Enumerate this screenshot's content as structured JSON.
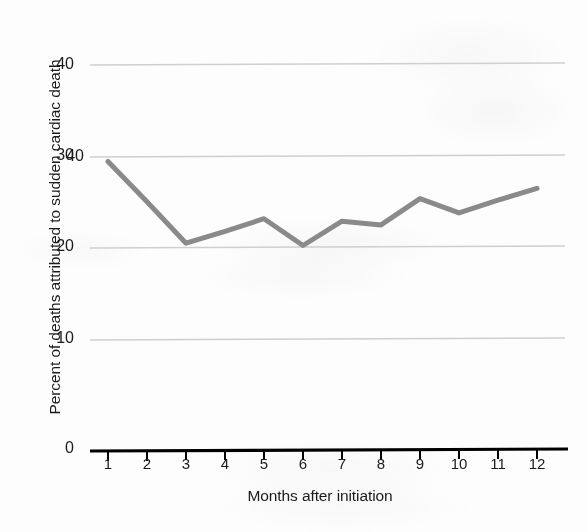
{
  "chart_data": {
    "type": "line",
    "title": "",
    "xlabel": "Months after initiation",
    "ylabel": "Percent of deaths attributed to sudden cardiac death",
    "x": [
      1,
      2,
      3,
      4,
      5,
      6,
      7,
      8,
      9,
      10,
      11,
      12
    ],
    "categories": [
      "1",
      "2",
      "3",
      "4",
      "5",
      "6",
      "7",
      "8",
      "9",
      "10",
      "11",
      "12"
    ],
    "values": [
      30,
      25.8,
      21.5,
      22.7,
      24,
      21.2,
      23.7,
      23.3,
      26,
      24.5,
      25.8,
      27
    ],
    "series": [
      {
        "name": "Percent of deaths attributed to sudden cardiac death",
        "values": [
          30,
          25.8,
          21.5,
          22.7,
          24,
          21.2,
          23.7,
          23.3,
          26,
          24.5,
          25.8,
          27
        ],
        "color": "#8a8a8a"
      }
    ],
    "xlim": [
      0.55,
      12.45
    ],
    "ylim": [
      0,
      41
    ],
    "ytick_labels": [
      "0",
      "10",
      "20",
      "30",
      "40"
    ],
    "yticks": [
      0,
      10,
      20,
      30,
      40
    ],
    "xtick_labels": [
      "1",
      "2",
      "3",
      "4",
      "5",
      "6",
      "7",
      "8",
      "9",
      "10",
      "11",
      "12"
    ],
    "grid": "horizontal",
    "gridline_color": "#cfcfcf",
    "axis_color": "#000000",
    "legend": "none",
    "background_color": "#fdfdfd"
  },
  "axes": {
    "x_axis_label": "Months after initiation",
    "y_axis_label": "Percent of deaths attributed to sudden cardiac death"
  }
}
